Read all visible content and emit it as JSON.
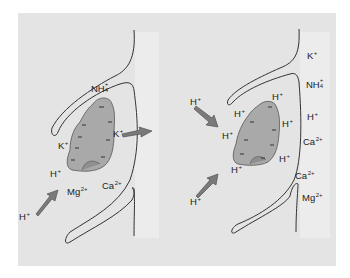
{
  "figure": {
    "colors": {
      "background": "#e4e4e4",
      "strip": "#ececec",
      "particle_fill": "#a9a9a9",
      "arrow_fill": "#7a7a7a",
      "line": "#333333"
    },
    "left_panel": {
      "labels": {
        "nh4": "NH",
        "nh4_sub": "4",
        "nh4_sup": "+",
        "k_right": "K",
        "k_right_sup": "+",
        "k_left": "K",
        "k_left_sup": "+",
        "h_near": "H",
        "h_near_sup": "+",
        "mg": "Mg",
        "mg_sup": "2+",
        "ca": "Ca",
        "ca_sup": "2+",
        "h_outside": "H",
        "h_outside_sup": "+"
      }
    },
    "right_panel": {
      "labels": {
        "h_in_arrow_top": "H",
        "h_in_arrow_bottom": "H",
        "h_top": "H",
        "h_left_upper": "H",
        "h_right": "H",
        "h_left": "H",
        "h_lower_right": "H",
        "h_bottom": "H",
        "sup_plus": "+",
        "k_col": "K",
        "nh4_col": "NH",
        "nh4_sub": "4",
        "h_col": "H",
        "ca_col_1": "Ca",
        "ca_col_2": "Ca",
        "mg_col": "Mg",
        "sup_2plus": "2+"
      }
    }
  }
}
